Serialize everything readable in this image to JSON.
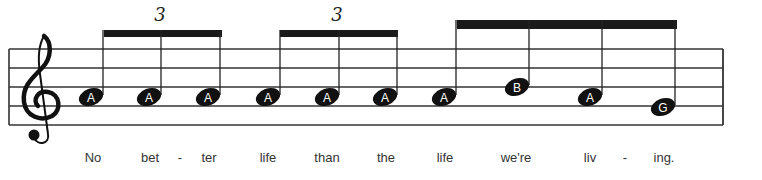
{
  "staff": {
    "clef": "treble",
    "x_start": 9,
    "x_end": 723,
    "lines_y": [
      49,
      68,
      87,
      106,
      125
    ],
    "line_color": "#333333"
  },
  "tuplets": [
    {
      "label": "3",
      "x": 160
    },
    {
      "label": "3",
      "x": 337
    }
  ],
  "beams": [
    {
      "x1": 104,
      "x2": 222,
      "y": 30,
      "h": 7
    },
    {
      "x1": 280,
      "x2": 398,
      "y": 30,
      "h": 7
    },
    {
      "x1": 457,
      "x2": 677,
      "y": 20,
      "h": 9
    }
  ],
  "notes": [
    {
      "name": "A",
      "x": 91,
      "y": 97,
      "stem_top": 30
    },
    {
      "name": "A",
      "x": 149,
      "y": 97,
      "stem_top": 30
    },
    {
      "name": "A",
      "x": 208,
      "y": 97,
      "stem_top": 30
    },
    {
      "name": "A",
      "x": 268,
      "y": 97,
      "stem_top": 30
    },
    {
      "name": "A",
      "x": 327,
      "y": 97,
      "stem_top": 30
    },
    {
      "name": "A",
      "x": 385,
      "y": 97,
      "stem_top": 30
    },
    {
      "name": "A",
      "x": 444,
      "y": 97,
      "stem_top": 20
    },
    {
      "name": "B",
      "x": 517,
      "y": 87,
      "stem_top": 20
    },
    {
      "name": "A",
      "x": 590,
      "y": 97,
      "stem_top": 20
    },
    {
      "name": "G",
      "x": 663,
      "y": 107,
      "stem_top": 20
    }
  ],
  "lyrics": [
    {
      "text": "No",
      "x": 93
    },
    {
      "text": "bet",
      "x": 150
    },
    {
      "text": "-",
      "x": 180
    },
    {
      "text": "ter",
      "x": 209
    },
    {
      "text": "life",
      "x": 268
    },
    {
      "text": "than",
      "x": 327
    },
    {
      "text": "the",
      "x": 386
    },
    {
      "text": "life",
      "x": 445
    },
    {
      "text": "we're",
      "x": 516
    },
    {
      "text": "liv",
      "x": 590
    },
    {
      "text": "-",
      "x": 625
    },
    {
      "text": "ing.",
      "x": 664
    }
  ]
}
